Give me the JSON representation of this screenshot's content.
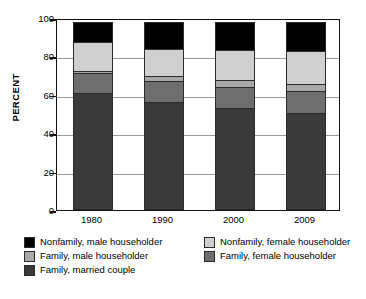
{
  "chart_data": {
    "type": "bar",
    "subtype": "stacked-bar-percent",
    "title": "",
    "xlabel": "",
    "ylabel": "PERCENT",
    "ylim": [
      0,
      100
    ],
    "yticks": [
      0,
      20,
      40,
      60,
      80,
      100
    ],
    "ytick_labels": [
      "0",
      "20",
      "40",
      "60",
      "80",
      "100"
    ],
    "grid": true,
    "grid_axis": "y",
    "legend_position": "below",
    "categories": [
      "1980",
      "1990",
      "2000",
      "2009"
    ],
    "stack_order_bottom_to_top": [
      "Family, married couple",
      "Family, female householder",
      "Family, male householder",
      "Nonfamily, female householder",
      "Nonfamily, male householder"
    ],
    "series": [
      {
        "name": "Family, married couple",
        "color": "#3a3a3a",
        "values": [
          61.0,
          56.0,
          53.0,
          50.6
        ]
      },
      {
        "name": "Family, female householder",
        "color": "#6e6e6e",
        "values": [
          11.0,
          11.6,
          11.8,
          11.8
        ]
      },
      {
        "name": "Family, male householder",
        "color": "#a8a8a8",
        "values": [
          1.7,
          3.4,
          4.2,
          4.4
        ]
      },
      {
        "name": "Nonfamily, female householder",
        "color": "#d0d0d0",
        "values": [
          15.5,
          14.5,
          16.0,
          17.5
        ]
      },
      {
        "name": "Nonfamily, male householder",
        "color": "#000000",
        "values": [
          10.8,
          14.5,
          15.0,
          15.7
        ]
      }
    ]
  },
  "legend": {
    "rows": [
      {
        "left": {
          "label": "Nonfamily, male householder",
          "color": "#000000"
        },
        "right": {
          "label": "Nonfamily, female householder",
          "color": "#d0d0d0"
        }
      },
      {
        "left": {
          "label": "Family, male householder",
          "color": "#a8a8a8"
        },
        "right": {
          "label": "Family, female householder",
          "color": "#6e6e6e"
        }
      },
      {
        "left": {
          "label": "Family, married couple",
          "color": "#3a3a3a"
        },
        "right": null
      }
    ]
  }
}
